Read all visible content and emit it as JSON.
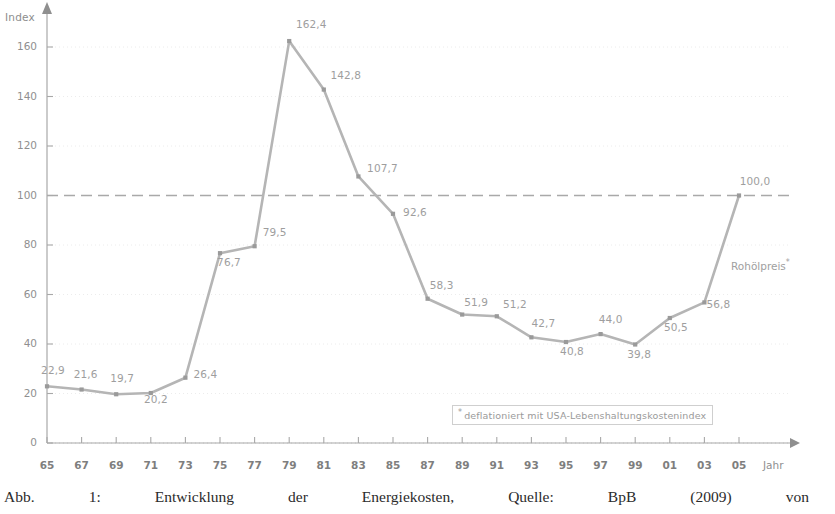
{
  "chart_data": {
    "type": "line",
    "title": "",
    "xlabel": "Jahr",
    "ylabel": "Index",
    "series_name": "Rohölpreis",
    "series_name_footnote_marker": "*",
    "categories": [
      "65",
      "67",
      "69",
      "71",
      "73",
      "75",
      "77",
      "79",
      "81",
      "83",
      "85",
      "87",
      "89",
      "91",
      "93",
      "95",
      "97",
      "99",
      "01",
      "03",
      "05"
    ],
    "x_tick_labels": [
      "65",
      "67",
      "69",
      "71",
      "73",
      "75",
      "77",
      "79",
      "81",
      "83",
      "85",
      "87",
      "89",
      "91",
      "93",
      "95",
      "97",
      "99",
      "01",
      "03",
      "05"
    ],
    "values": [
      22.9,
      21.6,
      19.7,
      20.2,
      26.4,
      76.7,
      79.5,
      162.4,
      142.8,
      107.7,
      92.6,
      58.3,
      51.9,
      51.2,
      42.7,
      40.8,
      44.0,
      39.8,
      50.5,
      56.8,
      100.0
    ],
    "point_labels": [
      "22,9",
      "21,6",
      "19,7",
      "20,2",
      "26,4",
      "76,7",
      "79,5",
      "162,4",
      "142,8",
      "107,7",
      "92,6",
      "58,3",
      "51,9",
      "51,2",
      "42,7",
      "40,8",
      "44,0",
      "39,8",
      "50,5",
      "56,8",
      "100,0"
    ],
    "y_tick_labels": [
      "0",
      "20",
      "40",
      "60",
      "80",
      "100",
      "120",
      "140",
      "160"
    ],
    "y_ticks": [
      0,
      20,
      40,
      60,
      80,
      100,
      120,
      140,
      160
    ],
    "ylim": [
      0,
      172
    ],
    "grid": true,
    "reference_line": {
      "value": 100,
      "style": "dashed"
    },
    "legend": "none",
    "line_color": "#b5b5b5",
    "text_color": "#9e9e9e"
  },
  "footnote": {
    "marker": "*",
    "text": "deflationiert mit USA-Lebenshaltungskostenindex"
  },
  "caption": {
    "words": [
      "Abb.",
      "1:",
      "Entwicklung",
      "der",
      "Energiekosten,",
      "Quelle:",
      "BpB",
      "(2009)",
      "von"
    ]
  }
}
